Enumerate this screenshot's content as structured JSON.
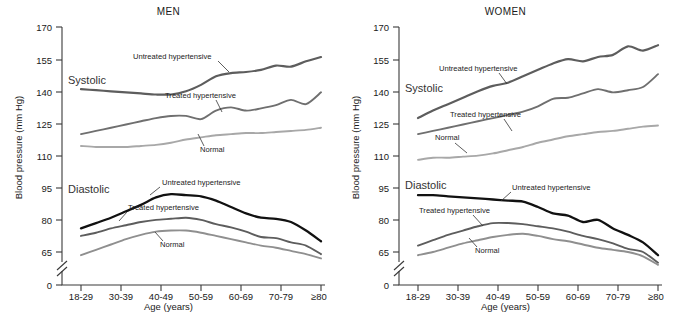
{
  "figure": {
    "ylabel": "Blood pressure (mm Hg)",
    "xlabel": "Age (years)"
  },
  "panels": [
    {
      "title": "MEN"
    },
    {
      "title": "WOMEN"
    }
  ],
  "labels": {
    "systolic": "Systolic",
    "diastolic": "Diastolic",
    "untreated": "Untreated hypertensive",
    "treated": "Treated hypertensive",
    "normal": "Normal"
  },
  "colors": {
    "untreated_systolic": "#5d5d5d",
    "treated_systolic": "#6f6f6f",
    "normal_systolic": "#a8a8a8",
    "untreated_diastolic": "#111111",
    "treated_diastolic": "#5d5d5d",
    "normal_diastolic": "#8f8f8f",
    "axis": "#3a3a3a",
    "text": "#1a1a1a"
  },
  "chart_data": [
    {
      "type": "line",
      "title": "MEN",
      "xlabel": "Age (years)",
      "ylabel": "Blood pressure (mm Hg)",
      "categories": [
        "18-29",
        "30-39",
        "40-49",
        "50-59",
        "60-69",
        "70-79",
        "≥80"
      ],
      "yticks": [
        0,
        65,
        80,
        95,
        110,
        125,
        140,
        155,
        170
      ],
      "ylim": [
        0,
        170
      ],
      "axis_break": "between 0 and 65",
      "grid": false,
      "legend": "inline annotations",
      "series": [
        {
          "name": "Systolic - Untreated hypertensive",
          "x": [
            18,
            22,
            26,
            30,
            34,
            38,
            42,
            46,
            50,
            54,
            58,
            62,
            66,
            70,
            74,
            78,
            82
          ],
          "values": [
            141,
            140.5,
            140,
            139.5,
            139,
            138.5,
            138.5,
            140,
            143,
            147,
            148.5,
            149,
            150,
            152,
            151.5,
            154,
            156
          ]
        },
        {
          "name": "Systolic - Treated hypertensive",
          "x": [
            18,
            22,
            26,
            30,
            34,
            38,
            42,
            46,
            50,
            54,
            58,
            62,
            66,
            70,
            74,
            78,
            82
          ],
          "values": [
            120,
            121.5,
            123,
            124.5,
            126,
            127.5,
            128.5,
            128.5,
            127,
            131,
            132.5,
            131,
            132,
            133.5,
            136,
            134,
            139.5
          ]
        },
        {
          "name": "Systolic - Normal",
          "x": [
            18,
            22,
            26,
            30,
            34,
            38,
            42,
            46,
            50,
            54,
            58,
            62,
            66,
            70,
            74,
            78,
            82
          ],
          "values": [
            114.5,
            114,
            114,
            114,
            114.5,
            115,
            116,
            117.5,
            118.5,
            119.5,
            120,
            120.5,
            120.5,
            121,
            121.5,
            122,
            123
          ]
        },
        {
          "name": "Diastolic - Untreated hypertensive",
          "x": [
            18,
            22,
            26,
            30,
            34,
            38,
            42,
            46,
            50,
            54,
            58,
            62,
            66,
            70,
            74,
            78,
            82
          ],
          "values": [
            76,
            78.5,
            81,
            84,
            87,
            90.5,
            92,
            91.5,
            91,
            89,
            86,
            83,
            81,
            80.5,
            79,
            75,
            70
          ]
        },
        {
          "name": "Diastolic - Treated hypertensive",
          "x": [
            18,
            22,
            26,
            30,
            34,
            38,
            42,
            46,
            50,
            54,
            58,
            62,
            66,
            70,
            74,
            78,
            82
          ],
          "values": [
            72.5,
            74,
            76,
            77.5,
            79,
            80,
            80.5,
            81,
            80,
            78,
            76.5,
            74.5,
            72,
            71.5,
            69.5,
            68,
            64
          ]
        },
        {
          "name": "Diastolic - Normal",
          "x": [
            18,
            22,
            26,
            30,
            34,
            38,
            42,
            46,
            50,
            54,
            58,
            62,
            66,
            70,
            74,
            78,
            82
          ],
          "values": [
            63.5,
            66,
            68.5,
            71,
            73,
            74.5,
            75,
            75,
            74,
            72.5,
            71,
            69.5,
            68,
            67,
            65.5,
            64,
            62
          ]
        }
      ]
    },
    {
      "type": "line",
      "title": "WOMEN",
      "xlabel": "Age (years)",
      "ylabel": "Blood pressure (mm Hg)",
      "categories": [
        "18-29",
        "30-39",
        "40-49",
        "50-59",
        "60-69",
        "70-79",
        "≥80"
      ],
      "yticks": [
        0,
        65,
        80,
        95,
        110,
        125,
        140,
        155,
        170
      ],
      "ylim": [
        0,
        170
      ],
      "axis_break": "between 0 and 65",
      "grid": false,
      "legend": "inline annotations",
      "series": [
        {
          "name": "Systolic - Untreated hypertensive",
          "x": [
            18,
            22,
            26,
            30,
            34,
            38,
            42,
            46,
            50,
            54,
            58,
            62,
            66,
            70,
            74,
            78,
            82
          ],
          "values": [
            127.5,
            131,
            134,
            137,
            140,
            142.5,
            144,
            147,
            150,
            153,
            155,
            154,
            156,
            157,
            161,
            159,
            161.5
          ]
        },
        {
          "name": "Systolic - Treated hypertensive",
          "x": [
            18,
            22,
            26,
            30,
            34,
            38,
            42,
            46,
            50,
            54,
            58,
            62,
            66,
            70,
            74,
            78,
            82
          ],
          "values": [
            120,
            121.5,
            123,
            124.5,
            126,
            127.5,
            129,
            130.5,
            133,
            136.5,
            137,
            139,
            141,
            139.5,
            140.5,
            142,
            148
          ]
        },
        {
          "name": "Systolic - Normal",
          "x": [
            18,
            22,
            26,
            30,
            34,
            38,
            42,
            46,
            50,
            54,
            58,
            62,
            66,
            70,
            74,
            78,
            82
          ],
          "values": [
            108,
            109,
            109,
            109.5,
            110,
            111,
            112.5,
            114,
            116,
            117.5,
            119,
            120,
            121,
            121.5,
            122.5,
            123.5,
            124
          ]
        },
        {
          "name": "Diastolic - Untreated hypertensive",
          "x": [
            18,
            22,
            26,
            30,
            34,
            38,
            42,
            46,
            50,
            54,
            58,
            62,
            66,
            70,
            74,
            78,
            82
          ],
          "values": [
            91.5,
            91.5,
            91,
            90.5,
            90,
            89.5,
            89,
            88.5,
            86,
            83,
            82,
            79,
            80,
            76,
            73,
            69.5,
            63.5
          ]
        },
        {
          "name": "Diastolic - Treated hypertensive",
          "x": [
            18,
            22,
            26,
            30,
            34,
            38,
            42,
            46,
            50,
            54,
            58,
            62,
            66,
            70,
            74,
            78,
            82
          ],
          "values": [
            68,
            70.5,
            73,
            75,
            77,
            78.5,
            78.5,
            78,
            77,
            76,
            74.5,
            72.5,
            71,
            69,
            66.5,
            65,
            60
          ]
        },
        {
          "name": "Diastolic - Normal",
          "x": [
            18,
            22,
            26,
            30,
            34,
            38,
            42,
            46,
            50,
            54,
            58,
            62,
            66,
            70,
            74,
            78,
            82
          ],
          "values": [
            63.5,
            65,
            67,
            69,
            70.5,
            72,
            73,
            73.5,
            72.5,
            71,
            70,
            68.5,
            67,
            66,
            65,
            63,
            59
          ]
        }
      ]
    }
  ]
}
